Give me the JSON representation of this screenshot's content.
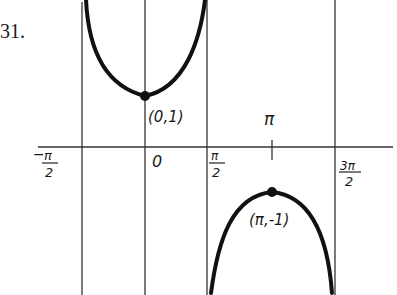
{
  "problem_number": "31.",
  "graph": {
    "function": "sec(x)",
    "x_axis_labels": {
      "neg_pi_over_2": {
        "num": "π",
        "den": "2",
        "sign": "−"
      },
      "zero": "0",
      "pi_over_2": {
        "num": "π",
        "den": "2"
      },
      "pi": "π",
      "three_pi_over_2": {
        "num": "3π",
        "den": "2"
      }
    },
    "points": [
      {
        "label": "(0,1)",
        "x": 0,
        "y": 1,
        "type": "local minimum"
      },
      {
        "label": "(π,-1)",
        "x": "π",
        "y": -1,
        "type": "local maximum"
      }
    ],
    "asymptotes": [
      "-π/2",
      "π/2",
      "3π/2"
    ],
    "colors": {
      "ink": "#1a1a1a",
      "background": "#ffffff"
    }
  }
}
